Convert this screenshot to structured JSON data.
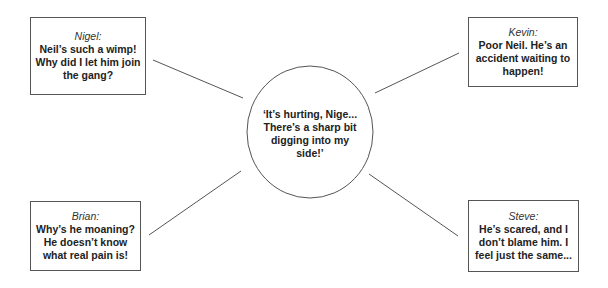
{
  "diagram": {
    "center": {
      "text": "‘It’s hurting, Nige... There’s a sharp bit digging into my side!’"
    },
    "boxes": [
      {
        "speaker": "Nigel:",
        "quote": "Neil’s such a wimp! Why did I let him join the gang?"
      },
      {
        "speaker": "Kevin:",
        "quote": "Poor Neil. He’s an accident waiting to happen!"
      },
      {
        "speaker": "Brian:",
        "quote": "Why’s he moaning? He doesn’t know what real pain is!"
      },
      {
        "speaker": "Steve:",
        "quote": "He’s scared, and I don’t blame him. I feel just the same..."
      }
    ],
    "colors": {
      "stroke": "#555555",
      "text": "#222222",
      "background": "#ffffff"
    }
  }
}
